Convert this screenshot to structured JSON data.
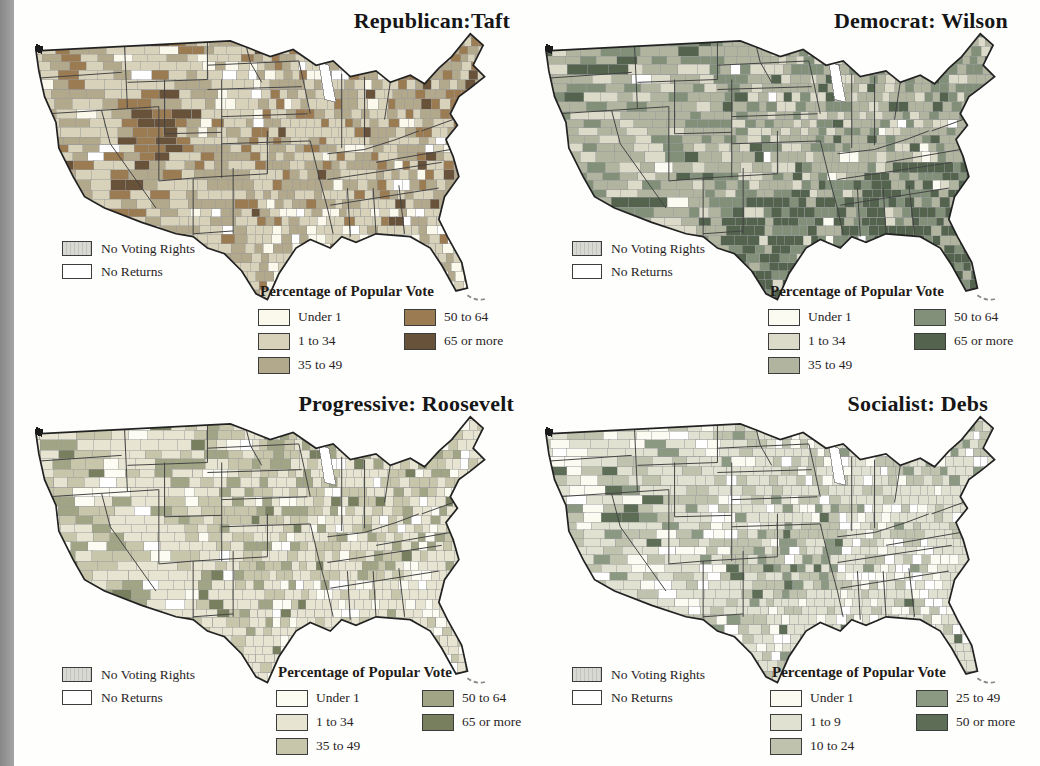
{
  "colors": {
    "page_bg": "#fefefd",
    "left_strip": "#979797",
    "county_border": "#9a9a9a",
    "state_border": "#454545",
    "outline": "#222222",
    "no_voting_rights_swatch": "#cfcfc7",
    "no_returns_swatch": "#ffffff"
  },
  "figure": {
    "panels": [
      {
        "party": "Republican",
        "candidate": "Taft",
        "title": "Republican:Taft",
        "no_data_legend": [
          {
            "label": "No Voting Rights",
            "swatch": "hatched"
          },
          {
            "label": "No Returns",
            "swatch": "plain"
          }
        ],
        "vote_legend": {
          "heading": "Percentage of Popular Vote",
          "items": [
            {
              "label": "Under 1",
              "color": "#fbf8ec"
            },
            {
              "label": "1 to 34",
              "color": "#d8d2ba"
            },
            {
              "label": "35 to 49",
              "color": "#b2a88c"
            },
            {
              "label": "50 to 64",
              "color": "#9a7b52"
            },
            {
              "label": "65 or more",
              "color": "#68523a"
            }
          ]
        },
        "map": {
          "seed": 11,
          "base": [
            0.06,
            0.42,
            0.36,
            0.13,
            0.03
          ],
          "regions": [
            {
              "x0": 0.5,
              "x1": 0.93,
              "y0": 0.56,
              "y1": 1.0,
              "weights": [
                0.35,
                0.45,
                0.14,
                0.05,
                0.01
              ]
            },
            {
              "x0": 0.18,
              "x1": 0.33,
              "y0": 0.25,
              "y1": 0.52,
              "weights": [
                0.02,
                0.18,
                0.3,
                0.35,
                0.15
              ]
            },
            {
              "x0": 0.36,
              "x1": 0.5,
              "y0": 0.12,
              "y1": 0.3,
              "weights": [
                0.3,
                0.5,
                0.16,
                0.03,
                0.01
              ]
            },
            {
              "x0": 0.8,
              "x1": 1.0,
              "y0": 0.05,
              "y1": 0.33,
              "weights": [
                0.02,
                0.22,
                0.44,
                0.26,
                0.06
              ]
            }
          ]
        }
      },
      {
        "party": "Democrat",
        "candidate": "Wilson",
        "title": "Democrat: Wilson",
        "no_data_legend": [
          {
            "label": "No Voting Rights",
            "swatch": "hatched"
          },
          {
            "label": "No Returns",
            "swatch": "plain"
          }
        ],
        "vote_legend": {
          "heading": "Percentage of Popular Vote",
          "items": [
            {
              "label": "Under 1",
              "color": "#fcfbf2"
            },
            {
              "label": "1 to 34",
              "color": "#dcdbc9"
            },
            {
              "label": "35 to 49",
              "color": "#b1b5a0"
            },
            {
              "label": "50 to 64",
              "color": "#82907a"
            },
            {
              "label": "65 or more",
              "color": "#53634d"
            }
          ]
        },
        "map": {
          "seed": 22,
          "base": [
            0.02,
            0.2,
            0.5,
            0.22,
            0.06
          ],
          "regions": [
            {
              "x0": 0.38,
              "x1": 0.75,
              "y0": 0.55,
              "y1": 1.0,
              "weights": [
                0.03,
                0.04,
                0.1,
                0.28,
                0.55
              ]
            },
            {
              "x0": 0.68,
              "x1": 1.0,
              "y0": 0.42,
              "y1": 1.0,
              "weights": [
                0.02,
                0.04,
                0.12,
                0.3,
                0.52
              ]
            },
            {
              "x0": 0.8,
              "x1": 1.0,
              "y0": 0.0,
              "y1": 0.3,
              "weights": [
                0.02,
                0.14,
                0.4,
                0.32,
                0.12
              ]
            },
            {
              "x0": 0.14,
              "x1": 0.3,
              "y0": 0.25,
              "y1": 0.5,
              "weights": [
                0.04,
                0.35,
                0.42,
                0.15,
                0.04
              ]
            }
          ]
        }
      },
      {
        "party": "Progressive",
        "candidate": "Roosevelt",
        "title": "Progressive: Roosevelt",
        "no_data_legend": [
          {
            "label": "No Voting Rights",
            "swatch": "hatched"
          },
          {
            "label": "No Returns",
            "swatch": "plain"
          }
        ],
        "vote_legend": {
          "heading": "Percentage of Popular Vote",
          "items": [
            {
              "label": "Under 1",
              "color": "#fdfcf3"
            },
            {
              "label": "1 to 34",
              "color": "#e7e5d1"
            },
            {
              "label": "35 to 49",
              "color": "#c7c6aa"
            },
            {
              "label": "50 to 64",
              "color": "#a1a585"
            },
            {
              "label": "65 or more",
              "color": "#787f5e"
            }
          ]
        },
        "map": {
          "seed": 33,
          "base": [
            0.1,
            0.5,
            0.28,
            0.1,
            0.02
          ],
          "regions": [
            {
              "x0": 0.5,
              "x1": 0.95,
              "y0": 0.55,
              "y1": 1.0,
              "weights": [
                0.32,
                0.5,
                0.14,
                0.03,
                0.01
              ]
            },
            {
              "x0": 0.36,
              "x1": 0.6,
              "y0": 0.08,
              "y1": 0.34,
              "weights": [
                0.04,
                0.28,
                0.38,
                0.24,
                0.06
              ]
            },
            {
              "x0": 0.0,
              "x1": 0.2,
              "y0": 0.3,
              "y1": 0.65,
              "weights": [
                0.06,
                0.35,
                0.35,
                0.18,
                0.06
              ]
            }
          ]
        }
      },
      {
        "party": "Socialist",
        "candidate": "Debs",
        "title": "Socialist: Debs",
        "no_data_legend": [
          {
            "label": "No Voting Rights",
            "swatch": "hatched"
          },
          {
            "label": "No Returns",
            "swatch": "plain"
          }
        ],
        "vote_legend": {
          "heading": "Percentage of Popular Vote",
          "items": [
            {
              "label": "Under 1",
              "color": "#fcfbf2"
            },
            {
              "label": "1 to 9",
              "color": "#e1e1d1"
            },
            {
              "label": "10 to 24",
              "color": "#bfc3ae"
            },
            {
              "label": "25 to 49",
              "color": "#8c9982"
            },
            {
              "label": "50 or more",
              "color": "#5e6e56"
            }
          ]
        },
        "map": {
          "seed": 44,
          "base": [
            0.2,
            0.5,
            0.24,
            0.05,
            0.01
          ],
          "regions": [
            {
              "x0": 0.4,
              "x1": 0.62,
              "y0": 0.36,
              "y1": 0.6,
              "weights": [
                0.06,
                0.28,
                0.36,
                0.22,
                0.08
              ]
            },
            {
              "x0": 0.7,
              "x1": 1.0,
              "y0": 0.45,
              "y1": 1.0,
              "weights": [
                0.38,
                0.46,
                0.13,
                0.02,
                0.01
              ]
            },
            {
              "x0": 0.12,
              "x1": 0.24,
              "y0": 0.22,
              "y1": 0.45,
              "weights": [
                0.08,
                0.3,
                0.32,
                0.2,
                0.1
              ]
            }
          ]
        }
      }
    ]
  }
}
